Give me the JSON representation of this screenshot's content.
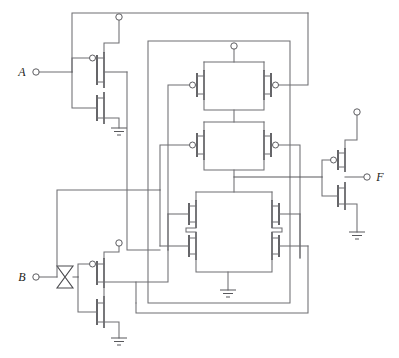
{
  "diagram": {
    "type": "cmos-logic-circuit",
    "line_color": "#6e6e72",
    "device_color": "#4a4a4e",
    "label_color": "#1d1d20",
    "background": "#ffffff"
  },
  "labels": {
    "input_a": "A",
    "input_b": "B",
    "output_f": "F"
  },
  "ports": [
    {
      "name": "input-a",
      "label": "A",
      "kind": "input",
      "x": 22,
      "y": 72
    },
    {
      "name": "input-b",
      "label": "B",
      "kind": "input",
      "x": 22,
      "y": 277
    },
    {
      "name": "output-f",
      "label": "F",
      "kind": "output",
      "x": 378,
      "y": 177
    }
  ],
  "supplies": [
    {
      "name": "vdd-inverter-a",
      "symbol": "open-circle",
      "x": 119,
      "y": 17
    },
    {
      "name": "vdd-center-block",
      "symbol": "open-circle",
      "x": 234,
      "y": 46
    },
    {
      "name": "vdd-output-inverter",
      "symbol": "open-circle",
      "x": 357,
      "y": 112
    },
    {
      "name": "vdd-inverter-b",
      "symbol": "open-circle",
      "x": 119,
      "y": 243
    }
  ],
  "grounds": [
    {
      "name": "gnd-inverter-a",
      "x": 119,
      "y": 128
    },
    {
      "name": "gnd-center-block",
      "x": 228,
      "y": 290
    },
    {
      "name": "gnd-output-inverter",
      "x": 357,
      "y": 232
    },
    {
      "name": "gnd-inverter-b",
      "x": 119,
      "y": 338
    }
  ],
  "transistors": [
    {
      "name": "pmos-inverter-a",
      "type": "pmos",
      "ref": "A-input inverter pull-up"
    },
    {
      "name": "nmos-inverter-a",
      "type": "nmos",
      "ref": "A-input inverter pull-down"
    },
    {
      "name": "pmos-inverter-b",
      "type": "pmos",
      "ref": "B-input inverter pull-up"
    },
    {
      "name": "nmos-inverter-b",
      "type": "nmos",
      "ref": "B-input inverter pull-down"
    },
    {
      "name": "pmos-top-left",
      "type": "pmos",
      "ref": "upper parallel pull-up left"
    },
    {
      "name": "pmos-top-right",
      "type": "pmos",
      "ref": "upper parallel pull-up right"
    },
    {
      "name": "pmos-mid-left",
      "type": "pmos",
      "ref": "lower parallel pull-up left"
    },
    {
      "name": "pmos-mid-right",
      "type": "pmos",
      "ref": "lower parallel pull-up right"
    },
    {
      "name": "nmos-bridge-upper-left",
      "type": "nmos",
      "ref": "pull-down network"
    },
    {
      "name": "nmos-bridge-upper-right",
      "type": "nmos",
      "ref": "pull-down network"
    },
    {
      "name": "nmos-bridge-lower-left",
      "type": "nmos",
      "ref": "pull-down network"
    },
    {
      "name": "nmos-bridge-lower-right",
      "type": "nmos",
      "ref": "pull-down network"
    },
    {
      "name": "pmos-output-inverter",
      "type": "pmos",
      "ref": "output inverter pull-up"
    },
    {
      "name": "nmos-output-inverter",
      "type": "nmos",
      "ref": "output inverter pull-down"
    }
  ],
  "markers": [
    {
      "name": "bowtie-marker-b",
      "shape": "hourglass",
      "x": 65,
      "y": 277
    }
  ]
}
